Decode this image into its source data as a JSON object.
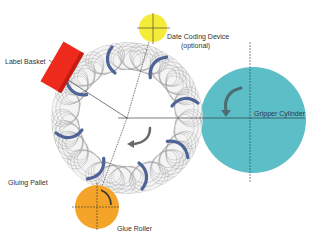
{
  "labels": {
    "date_coding": "Date Coding Device",
    "date_coding_sub": "(optional)",
    "label_basket": "Label Basket",
    "gripper_cylinder": "Gripper Cylinder",
    "gluing_pallet": "Gluing Pallet",
    "glue_roller": "Glue Roller"
  },
  "colors": {
    "date_coding": "#f5ec3a",
    "label_basket": "#ee2a1c",
    "gripper_cylinder": "#5cbfc8",
    "glue_roller": "#f4a428",
    "pallet": "#4f6496",
    "arrow": "#5f6f6f",
    "line": "#222222"
  },
  "components": [
    {
      "name": "date-coding-device",
      "shape": "circle",
      "cx": 153,
      "cy": 28,
      "r": 14
    },
    {
      "name": "label-basket",
      "shape": "rect",
      "cx": 60,
      "cy": 65,
      "w": 22,
      "h": 46,
      "rotation": 30
    },
    {
      "name": "gluing-pallet-carousel",
      "shape": "ring",
      "cx": 127,
      "cy": 118,
      "r_outer": 76,
      "r_inner": 48
    },
    {
      "name": "gripper-cylinder",
      "shape": "circle",
      "cx": 253,
      "cy": 120,
      "r": 53
    },
    {
      "name": "glue-roller",
      "shape": "circle",
      "cx": 97,
      "cy": 207,
      "r": 22
    }
  ]
}
